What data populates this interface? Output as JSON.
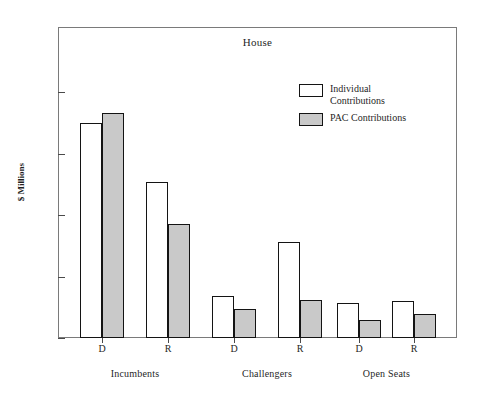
{
  "chart_data": {
    "type": "bar",
    "title": "House",
    "xlabel": "",
    "ylabel": "$ Millions",
    "ylim": [
      0,
      44
    ],
    "grid": false,
    "legend_position": "top-right",
    "categories": [
      "D",
      "R",
      "D",
      "R",
      "D",
      "R"
    ],
    "groups": [
      {
        "label": "Incumbents",
        "members": [
          "D",
          "R"
        ]
      },
      {
        "label": "Challengers",
        "members": [
          "D",
          "R"
        ]
      },
      {
        "label": "Open Seats",
        "members": [
          "D",
          "R"
        ]
      }
    ],
    "series": [
      {
        "name": "Individual\nContributions",
        "color": "#ffffff",
        "values": [
          35.0,
          25.4,
          6.8,
          15.6,
          5.7,
          6.0
        ]
      },
      {
        "name": "PAC Contributions",
        "color": "#c9c9c9",
        "values": [
          36.6,
          18.6,
          4.7,
          6.2,
          2.9,
          3.9
        ]
      }
    ],
    "y_ticks": [
      {
        "value": 40,
        "label": "$40"
      },
      {
        "value": 30,
        "label": "30"
      },
      {
        "value": 20,
        "label": "20"
      },
      {
        "value": 10,
        "label": "10"
      },
      {
        "value": 0,
        "label": "0"
      }
    ]
  },
  "legend": {
    "items": [
      {
        "label": "Individual\nContributions",
        "swatch": "individual"
      },
      {
        "label": "PAC Contributions",
        "swatch": "pac"
      }
    ]
  },
  "axis": {
    "y_title": "$ Millions"
  }
}
